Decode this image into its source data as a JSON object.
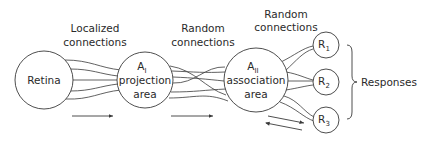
{
  "diagram": {
    "type": "flow",
    "stroke_color": "#3a3a3a",
    "text_color": "#2a2a2a",
    "nodes": [
      {
        "id": "retina",
        "label": "Retina"
      },
      {
        "id": "a1",
        "label_main": "A",
        "label_sub": "I",
        "line2": "projection",
        "line3": "area"
      },
      {
        "id": "a2",
        "label_main": "A",
        "label_sub": "II",
        "line2": "association",
        "line3": "area"
      },
      {
        "id": "r1",
        "label_main": "R",
        "label_sub": "1"
      },
      {
        "id": "r2",
        "label_main": "R",
        "label_sub": "2"
      },
      {
        "id": "r3",
        "label_main": "R",
        "label_sub": "3"
      }
    ],
    "edge_labels": [
      {
        "line1": "Localized",
        "line2": "connections"
      },
      {
        "line1": "Random",
        "line2": "connections"
      },
      {
        "line1": "Random",
        "line2": "connections"
      }
    ],
    "group_label": "Responses",
    "edges": [
      {
        "from": "retina",
        "to": "a1",
        "kind": "localized"
      },
      {
        "from": "a1",
        "to": "a2",
        "kind": "random"
      },
      {
        "from": "a2",
        "to": "r1",
        "kind": "random"
      },
      {
        "from": "a2",
        "to": "r2",
        "kind": "random"
      },
      {
        "from": "a2",
        "to": "r3",
        "kind": "random"
      }
    ],
    "flow_arrows": [
      {
        "direction": "forward",
        "segment": "retina-to-a1"
      },
      {
        "direction": "forward",
        "segment": "a1-to-a2"
      },
      {
        "direction": "bidirectional",
        "segment": "a2-to-responses"
      }
    ]
  }
}
